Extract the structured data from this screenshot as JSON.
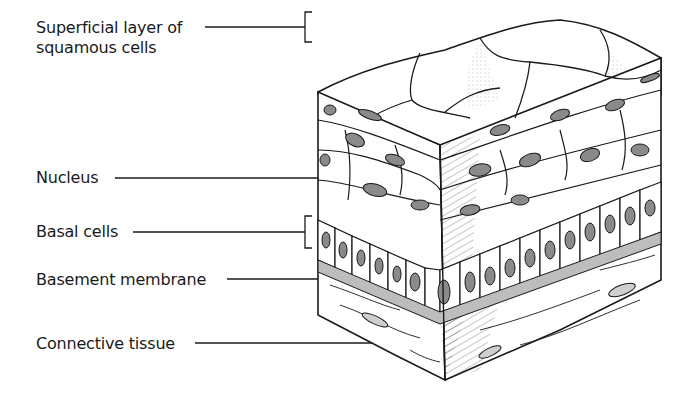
{
  "diagram": {
    "labels": [
      {
        "id": "superficial",
        "line1": "Superficial layer of",
        "line2": "squamous cells"
      },
      {
        "id": "nucleus",
        "line1": "Nucleus"
      },
      {
        "id": "basal",
        "line1": "Basal cells"
      },
      {
        "id": "basement",
        "line1": "Basement membrane"
      },
      {
        "id": "connective",
        "line1": "Connective tissue"
      }
    ]
  },
  "colors": {
    "ink": "#1a1a1a",
    "membrane": "#bdbdbd",
    "nucleus_fill": "#8a8a8a",
    "background": "#ffffff"
  }
}
